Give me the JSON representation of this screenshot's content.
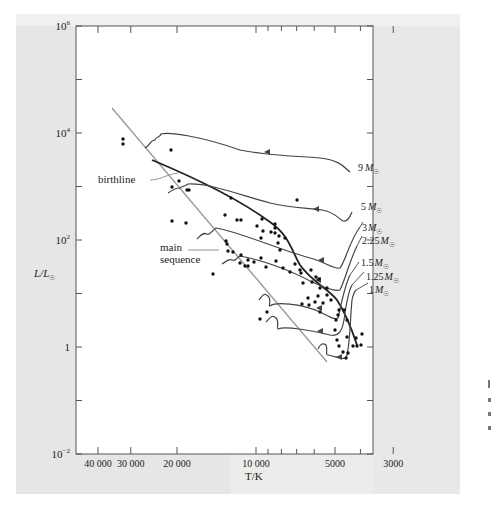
{
  "chart_data": {
    "type": "scatter",
    "title": "",
    "xlabel": "T/K",
    "ylabel": "L/L☉",
    "x_scale": "log_reversed",
    "y_scale": "log",
    "xlim": [
      45000,
      2500
    ],
    "ylim": [
      0.01,
      1000000
    ],
    "x_ticks": [
      {
        "value": 40000,
        "label": "40 000"
      },
      {
        "value": 30000,
        "label": "30 000"
      },
      {
        "value": 20000,
        "label": "20 000"
      },
      {
        "value": 10000,
        "label": "10 000"
      },
      {
        "value": 5000,
        "label": "5000"
      },
      {
        "value": 3000,
        "label": "3000"
      }
    ],
    "y_ticks": [
      {
        "value": 1000000,
        "label": "10",
        "sup": "6"
      },
      {
        "value": 10000,
        "label": "10",
        "sup": "4"
      },
      {
        "value": 100,
        "label": "10",
        "sup": "2"
      },
      {
        "value": 1,
        "label": "1",
        "sup": ""
      },
      {
        "value": 0.01,
        "label": "10",
        "sup": "−2"
      }
    ],
    "annotations": {
      "birthline": "birthline",
      "main_sequence_1": "main",
      "main_sequence_2": "sequence"
    },
    "tracks": [
      {
        "name": "9 M☉",
        "mass": "9",
        "unit": "M",
        "sub": "☉"
      },
      {
        "name": "5 M☉",
        "mass": "5",
        "unit": "M",
        "sub": "☉"
      },
      {
        "name": "3 M☉",
        "mass": "3",
        "unit": "M",
        "sub": "☉"
      },
      {
        "name": "2.25 M☉",
        "mass": "2.25",
        "unit": "M",
        "sub": "☉"
      },
      {
        "name": "1.5 M☉",
        "mass": "1.5",
        "unit": "M",
        "sub": "☉"
      },
      {
        "name": "1.25 M☉",
        "mass": "1.25",
        "unit": "M",
        "sub": "☉"
      },
      {
        "name": "1 M☉",
        "mass": "1",
        "unit": "M",
        "sub": "☉"
      }
    ],
    "series": [
      {
        "name": "observed stars",
        "type": "scatter",
        "points_px": [
          [
            123,
            139
          ],
          [
            123,
            144
          ],
          [
            171,
            150
          ],
          [
            179,
            181
          ],
          [
            172,
            187
          ],
          [
            187,
            190
          ],
          [
            189,
            190
          ],
          [
            172,
            221
          ],
          [
            186,
            223
          ],
          [
            231,
            198
          ],
          [
            225,
            215
          ],
          [
            237,
            220
          ],
          [
            241,
            220
          ],
          [
            257,
            226
          ],
          [
            262,
            219
          ],
          [
            275,
            224
          ],
          [
            275,
            228
          ],
          [
            271,
            232
          ],
          [
            275,
            233
          ],
          [
            285,
            238
          ],
          [
            279,
            236
          ],
          [
            278,
            243
          ],
          [
            297,
            200
          ],
          [
            261,
            238
          ],
          [
            263,
            231
          ],
          [
            280,
            250
          ],
          [
            227,
            244
          ],
          [
            241,
            255
          ],
          [
            248,
            260
          ],
          [
            276,
            261
          ],
          [
            295,
            264
          ],
          [
            301,
            273
          ],
          [
            311,
            270
          ],
          [
            312,
            282
          ],
          [
            316,
            277
          ],
          [
            319,
            279
          ],
          [
            327,
            288
          ],
          [
            320,
            288
          ],
          [
            318,
            296
          ],
          [
            327,
            295
          ],
          [
            308,
            298
          ],
          [
            331,
            300
          ],
          [
            315,
            302
          ],
          [
            323,
            303
          ],
          [
            302,
            304
          ],
          [
            309,
            305
          ],
          [
            339,
            310
          ],
          [
            344,
            310
          ],
          [
            338,
            315
          ],
          [
            336,
            320
          ],
          [
            347,
            320
          ],
          [
            320,
            312
          ],
          [
            335,
            330
          ],
          [
            337,
            340
          ],
          [
            347,
            337
          ],
          [
            339,
            346
          ],
          [
            353,
            346
          ],
          [
            348,
            353
          ],
          [
            343,
            352
          ],
          [
            346,
            358
          ],
          [
            357,
            346
          ],
          [
            361,
            345
          ],
          [
            356,
            338
          ],
          [
            362,
            334
          ],
          [
            267,
            312
          ],
          [
            260,
            319
          ],
          [
            226,
            241
          ],
          [
            233,
            252
          ],
          [
            240,
            263
          ],
          [
            248,
            266
          ],
          [
            228,
            251
          ],
          [
            245,
            266
          ],
          [
            254,
            262
          ],
          [
            261,
            258
          ],
          [
            266,
            267
          ],
          [
            283,
            268
          ],
          [
            290,
            272
          ],
          [
            300,
            270
          ],
          [
            303,
            283
          ],
          [
            213,
            274
          ]
        ]
      }
    ]
  },
  "figure": {
    "ylabel_main": "L/L",
    "ylabel_sub": "☉",
    "xlabel": "T/K"
  }
}
